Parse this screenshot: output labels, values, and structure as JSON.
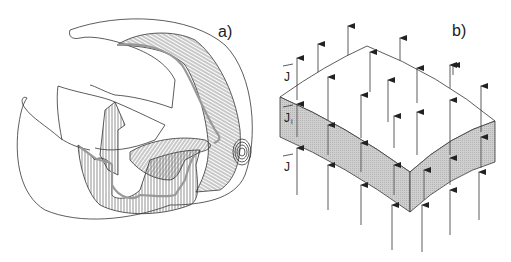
{
  "figure": {
    "panel_a": {
      "label": "a)",
      "description": "Cutaway line drawing of a curved shell with hatched (striated) inner layers spiralling to a concentric focus"
    },
    "panel_b": {
      "label": "b)",
      "labels": {
        "current_above": "J",
        "current_inside": "J",
        "current_inside_subscript": "i",
        "current_below": "J"
      },
      "description": "Curved slab (shaded side faces) penetrated by vertical upward current-density arrows"
    },
    "colors": {
      "line": "#333333",
      "slab_side_fill": "#c8c8c8",
      "background": "#ffffff"
    }
  }
}
